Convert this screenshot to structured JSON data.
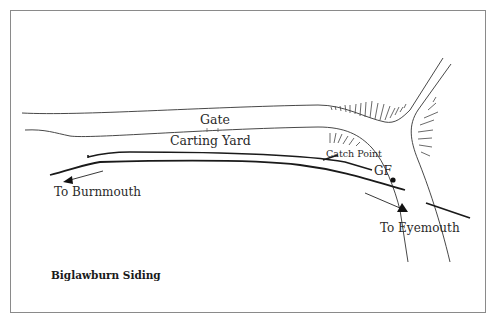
{
  "diagram": {
    "title": "Biglawburn Siding",
    "labels": {
      "gate": "Gate",
      "carting_yard": "Carting Yard",
      "catch_point": "Catch Point",
      "ground_frame": "GF",
      "to_burnmouth": "To Burnmouth",
      "to_eyemouth": "To Eyemouth"
    },
    "elements": [
      {
        "name": "main-line",
        "type": "railway track"
      },
      {
        "name": "siding",
        "type": "railway track"
      },
      {
        "name": "road",
        "type": "road with embankment hatching"
      },
      {
        "name": "direction-arrow-burnmouth",
        "direction": "west"
      },
      {
        "name": "direction-arrow-eyemouth",
        "direction": "south-east"
      },
      {
        "name": "ground-frame-marker",
        "type": "dot"
      }
    ],
    "colors": {
      "line": "#222222",
      "frame": "#888888",
      "text": "#2a2a2a"
    }
  }
}
